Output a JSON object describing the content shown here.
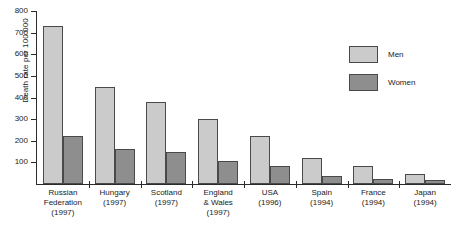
{
  "chart_data": {
    "type": "bar",
    "title": "",
    "xlabel": "",
    "ylabel": "Death rate per 100 000",
    "ylim": [
      0,
      800
    ],
    "ytick_step": 100,
    "yticks": [
      "800",
      "700",
      "600",
      "500",
      "400",
      "300",
      "200",
      "100"
    ],
    "grid": false,
    "legend_position": "top-right",
    "categories": [
      "Russian Federation (1997)",
      "Hungary (1997)",
      "Scotland (1997)",
      "England & Wales (1997)",
      "USA (1996)",
      "Spain (1994)",
      "France (1994)",
      "Japan (1994)"
    ],
    "category_lines": [
      [
        "Russian",
        "Federation",
        "(1997)"
      ],
      [
        "Hungary",
        "(1997)"
      ],
      [
        "Scotland",
        "(1997)"
      ],
      [
        "England",
        "& Wales",
        "(1997)"
      ],
      [
        "USA",
        "(1996)"
      ],
      [
        "Spain",
        "(1994)"
      ],
      [
        "France",
        "(1994)"
      ],
      [
        "Japan",
        "(1994)"
      ]
    ],
    "series": [
      {
        "name": "Men",
        "color": "#cbcbcb",
        "values": [
          730,
          450,
          380,
          300,
          220,
          120,
          85,
          45
        ]
      },
      {
        "name": "Women",
        "color": "#8e8e8e",
        "values": [
          220,
          160,
          150,
          105,
          85,
          35,
          25,
          18
        ]
      }
    ]
  },
  "legend": {
    "items": [
      {
        "label": "Men",
        "color": "#cbcbcb"
      },
      {
        "label": "Women",
        "color": "#8e8e8e"
      }
    ]
  }
}
